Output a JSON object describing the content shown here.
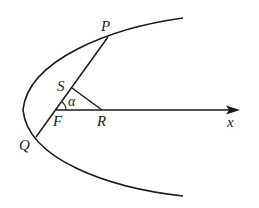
{
  "diagram": {
    "stroke_color": "#1a1a1a",
    "background": "#ffffff",
    "labels": {
      "P": "P",
      "S": "S",
      "F": "F",
      "R": "R",
      "Q": "Q",
      "x": "x",
      "alpha": "α"
    },
    "points": {
      "P": [
        108,
        37
      ],
      "S": [
        72,
        88
      ],
      "F": [
        56,
        110
      ],
      "R": [
        102,
        110
      ],
      "Q": [
        36,
        137
      ]
    },
    "curves": [
      "parabola opening right, vertex near (23,110)"
    ],
    "segments": [
      "PQ (focal chord through F)",
      "SR",
      "FR along x-axis"
    ],
    "axis": {
      "label": "x",
      "direction": "right"
    },
    "angle": {
      "label": "α",
      "between": [
        "FR",
        "FS"
      ]
    }
  }
}
